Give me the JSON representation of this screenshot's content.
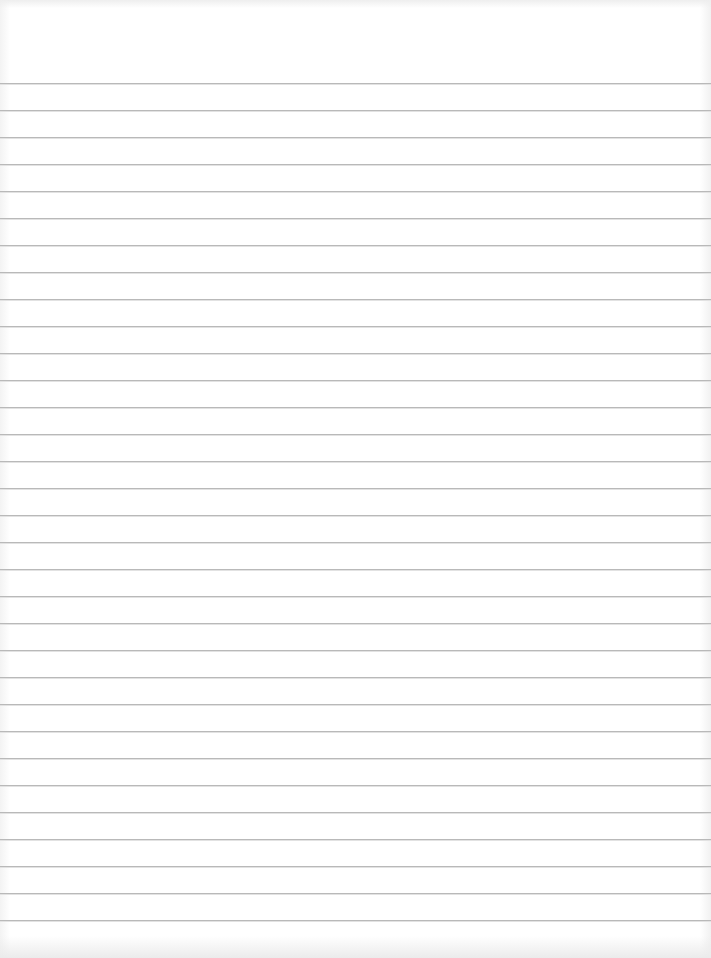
{
  "page": {
    "type": "lined-paper",
    "width": 711,
    "height": 958,
    "background_color": "#ffffff",
    "rule_color": "#b9b9b9"
  },
  "rules": {
    "count": 32,
    "first_y": 83,
    "spacing": 27
  }
}
